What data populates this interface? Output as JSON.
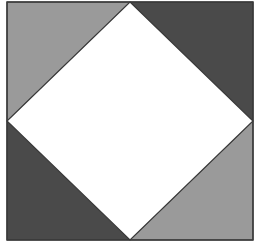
{
  "diagram": {
    "outer_square": {
      "x": 7,
      "y": 2,
      "width": 246,
      "height": 238,
      "stroke": "#3a3a3a"
    },
    "inner_diamond": {
      "fill": "#ffffff",
      "stroke": "#3a3a3a",
      "vertices": [
        [
          130,
          2
        ],
        [
          253,
          121
        ],
        [
          130,
          240
        ],
        [
          7,
          121
        ]
      ]
    },
    "triangles": [
      {
        "id": "top-left",
        "fill": "#9a9a9a",
        "points": "7,2 130,2 7,121"
      },
      {
        "id": "top-right",
        "fill": "#4a4a4a",
        "points": "130,2 253,2 253,121"
      },
      {
        "id": "bottom-left",
        "fill": "#4a4a4a",
        "points": "7,121 7,240 130,240"
      },
      {
        "id": "bottom-right",
        "fill": "#9a9a9a",
        "points": "253,121 253,240 130,240"
      }
    ],
    "colors": {
      "light_gray": "#9a9a9a",
      "dark_gray": "#4a4a4a",
      "white": "#ffffff",
      "outline": "#3a3a3a"
    }
  }
}
